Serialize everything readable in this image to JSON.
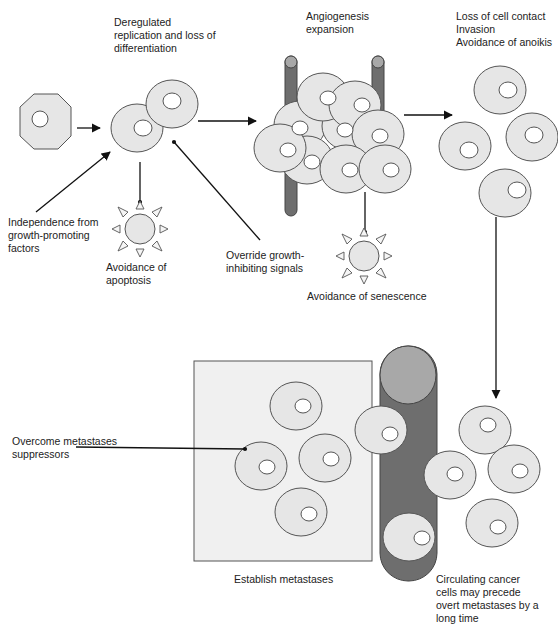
{
  "diagram": {
    "labels": {
      "deregulated": "Deregulated\nreplication and loss of\ndifferentiation",
      "angiogenesis": "Angiogenesis\nexpansion",
      "loss_contact": "Loss of cell contact\nInvasion\nAvoidance of anoikis",
      "independence": "Independence from\ngrowth-promoting\nfactors",
      "apoptosis": "Avoidance of\napoptosis",
      "override": "Override growth-\ninhibiting signals",
      "senescence": "Avoidance of senescence",
      "suppressors": "Overcome metastases\nsuppressors",
      "establish": "Establish metastases",
      "circulating": "Circulating cancer\ncells may precede\novert metastases by a\nlong time"
    },
    "colors": {
      "cell_fill": "#e6e6e6",
      "cell_stroke": "#555555",
      "vessel_dark": "#6e6e6e",
      "vessel_light": "#a8a8a8",
      "tissue_box": "#f0f0f0",
      "arrow": "#111111"
    }
  }
}
